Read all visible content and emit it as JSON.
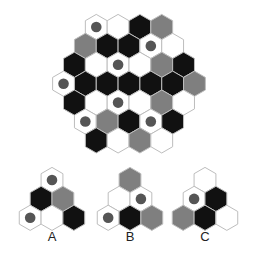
{
  "colors": {
    "white": "#ffffff",
    "black": "#111111",
    "gray": "#7f7f7f",
    "dot": "#555555",
    "stroke": "#bdbdbd"
  },
  "main_grid": {
    "center_x": 129,
    "top_y": 27,
    "radius": 12.6,
    "rows": [
      [
        "white-dot",
        "white",
        "black",
        "gray"
      ],
      [
        "gray",
        "black",
        "black",
        "white-dot",
        "white"
      ],
      [
        "black",
        "white",
        "white-dot",
        "white",
        "gray",
        "black"
      ],
      [
        "white-dot",
        "black",
        "black",
        "black",
        "black",
        "black",
        "gray"
      ],
      [
        "black",
        "white",
        "white-dot",
        "white",
        "gray",
        "white"
      ],
      [
        "white-dot",
        "gray",
        "black",
        "white-dot",
        "black"
      ],
      [
        "black",
        "white",
        "gray",
        "white"
      ]
    ]
  },
  "options": [
    {
      "label": "A",
      "center_x": 52,
      "top_y": 180,
      "rows": [
        [
          "white-dot"
        ],
        [
          "black",
          "gray"
        ],
        [
          "white-dot",
          "white",
          "black"
        ]
      ]
    },
    {
      "label": "B",
      "center_x": 130,
      "top_y": 180,
      "rows": [
        [
          "gray"
        ],
        [
          "white",
          "white-dot"
        ],
        [
          "white-dot",
          "black",
          "gray"
        ]
      ]
    },
    {
      "label": "C",
      "center_x": 205,
      "top_y": 180,
      "rows": [
        [
          "white"
        ],
        [
          "white-dot",
          "black"
        ],
        [
          "gray",
          "black",
          "white"
        ]
      ]
    }
  ],
  "option_labels": {
    "a": "A",
    "b": "B",
    "c": "C"
  }
}
